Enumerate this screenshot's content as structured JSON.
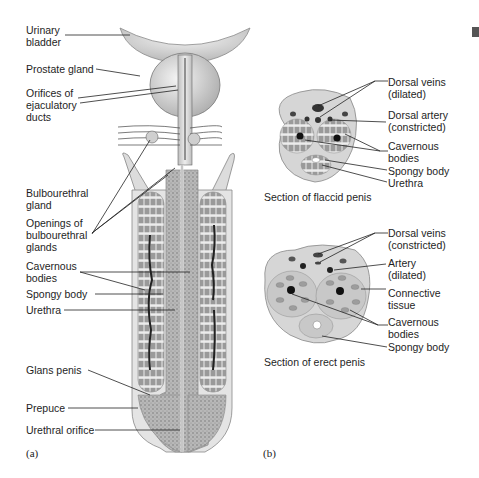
{
  "figure": {
    "panel_a": {
      "letter": "(a)",
      "labels": [
        {
          "id": "urinary-bladder",
          "text": "Urinary\nbladder"
        },
        {
          "id": "prostate-gland",
          "text": "Prostate gland"
        },
        {
          "id": "orifices-ejaculatory-ducts",
          "text": "Orifices of\nejaculatory\nducts"
        },
        {
          "id": "bulbourethral-gland",
          "text": "Bulbourethral\ngland"
        },
        {
          "id": "openings-bulbourethral-glands",
          "text": "Openings of\nbulbourethral\nglands"
        },
        {
          "id": "cavernous-bodies",
          "text": "Cavernous\nbodies"
        },
        {
          "id": "spongy-body",
          "text": "Spongy body"
        },
        {
          "id": "urethra",
          "text": "Urethra"
        },
        {
          "id": "glans-penis",
          "text": "Glans penis"
        },
        {
          "id": "prepuce",
          "text": "Prepuce"
        },
        {
          "id": "urethral-orifice",
          "text": "Urethral orifice"
        }
      ]
    },
    "panel_b": {
      "letter": "(b)",
      "flaccid": {
        "caption": "Section of flaccid penis",
        "labels": [
          {
            "id": "dorsal-veins-dilated",
            "text": "Dorsal veins\n(dilated)"
          },
          {
            "id": "dorsal-artery-constricted",
            "text": "Dorsal artery\n(constricted)"
          },
          {
            "id": "cavernous-bodies",
            "text": "Cavernous\nbodies"
          },
          {
            "id": "spongy-body",
            "text": "Spongy body"
          },
          {
            "id": "urethra",
            "text": "Urethra"
          }
        ]
      },
      "erect": {
        "caption": "Section of erect penis",
        "labels": [
          {
            "id": "dorsal-veins-constricted",
            "text": "Dorsal veins\n(constricted)"
          },
          {
            "id": "artery-dilated",
            "text": "Artery\n(dilated)"
          },
          {
            "id": "connective-tissue",
            "text": "Connective\ntissue"
          },
          {
            "id": "cavernous-bodies",
            "text": "Cavernous\nbodies"
          },
          {
            "id": "spongy-body",
            "text": "Spongy body"
          }
        ]
      }
    }
  }
}
